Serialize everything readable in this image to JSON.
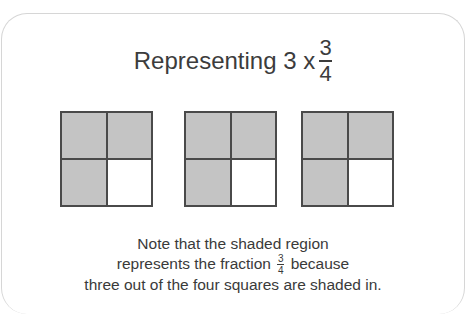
{
  "title": {
    "prefix": "Representing 3 x",
    "fraction": {
      "numerator": "3",
      "denominator": "4"
    }
  },
  "diagram": {
    "shaded_color": "#c4c4c4",
    "border_color": "#4a4a4a",
    "squares": [
      {
        "cells": [
          "shaded",
          "shaded",
          "shaded",
          "empty"
        ]
      },
      {
        "cells": [
          "shaded",
          "shaded",
          "shaded",
          "empty"
        ]
      },
      {
        "cells": [
          "shaded",
          "shaded",
          "shaded",
          "empty"
        ]
      }
    ]
  },
  "note": {
    "line1": "Note that the shaded region",
    "line2_before": "represents the fraction",
    "line2_fraction": {
      "numerator": "3",
      "denominator": "4"
    },
    "line2_after": "because",
    "line3": "three out of the four squares are shaded in."
  }
}
